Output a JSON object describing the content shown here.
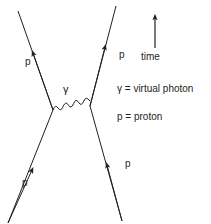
{
  "diagram": {
    "type": "feynman-diagram",
    "background_color": "#ffffff",
    "line_color": "#231f20",
    "text_color": "#231f20",
    "incoming": [
      {
        "id": "in-left",
        "label": "p",
        "label_x": 25,
        "label_y": 57
      },
      {
        "id": "in-right",
        "label": "p",
        "label_x": 125,
        "label_y": 159
      }
    ],
    "outgoing": [
      {
        "id": "out-left",
        "label": "p",
        "label_x": 22,
        "label_y": 178
      },
      {
        "id": "out-right",
        "label": "p",
        "label_x": 119,
        "label_y": 50
      }
    ],
    "propagator": {
      "id": "virtual-photon",
      "label": "γ",
      "label_x": 63,
      "label_y": 84,
      "style": "wavy"
    },
    "time_axis": {
      "label": "time",
      "label_x": 141,
      "label_y": 52,
      "direction": "up"
    },
    "legend": [
      {
        "symbol": "γ",
        "text": "γ = virtual photon"
      },
      {
        "symbol": "p",
        "text": "p = proton"
      }
    ]
  }
}
